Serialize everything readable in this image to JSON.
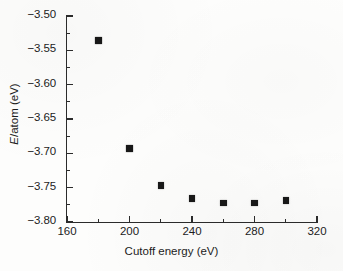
{
  "figure": {
    "caption_none": "",
    "background_color": "#fdfdfc",
    "ink_color": "#1c1c1c",
    "marker_color": "#181818"
  },
  "chart_data": {
    "type": "scatter",
    "title": "",
    "xlabel": "Cutoff energy (eV)",
    "ylabel": "E/atom (eV)",
    "ylabel_symbol": "E",
    "ylabel_rest": "/atom (eV)",
    "xlim": [
      160,
      320
    ],
    "ylim": [
      -3.8,
      -3.5
    ],
    "xticks": [
      160,
      200,
      240,
      280,
      320
    ],
    "xtick_labels": [
      "160",
      "200",
      "240",
      "280",
      "320"
    ],
    "x_minor_ticks": [
      180,
      220,
      260,
      300
    ],
    "yticks": [
      -3.5,
      -3.55,
      -3.6,
      -3.65,
      -3.7,
      -3.75,
      -3.8
    ],
    "ytick_labels": [
      "-3.50",
      "-3.55",
      "-3.60",
      "-3.65",
      "-3.70",
      "-3.75",
      "-3.80"
    ],
    "y_minor_ticks": [
      -3.525,
      -3.575,
      -3.625,
      -3.675,
      -3.725,
      -3.775
    ],
    "grid": false,
    "legend": null,
    "marker_style": "filled-square",
    "x": [
      180,
      200,
      220,
      240,
      260,
      280,
      300
    ],
    "y": [
      -3.536,
      -3.693,
      -3.747,
      -3.766,
      -3.772,
      -3.772,
      -3.769
    ],
    "points": [
      {
        "x": 180,
        "y": -3.536
      },
      {
        "x": 200,
        "y": -3.693
      },
      {
        "x": 220,
        "y": -3.747
      },
      {
        "x": 240,
        "y": -3.766
      },
      {
        "x": 260,
        "y": -3.772
      },
      {
        "x": 280,
        "y": -3.772
      },
      {
        "x": 300,
        "y": -3.769
      }
    ],
    "axis_spines": [
      "left",
      "bottom"
    ],
    "tick_direction": "in"
  }
}
